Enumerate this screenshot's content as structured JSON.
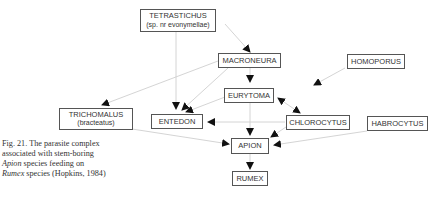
{
  "diagram": {
    "nodes": {
      "tetrastichus": {
        "label": "TETRASTICHUS",
        "sub": "(sp. nr evonymellae)"
      },
      "macroneura": {
        "label": "MACRONEURA"
      },
      "homoporus": {
        "label": "HOMOPORUS"
      },
      "eurytoma": {
        "label": "EURYTOMA"
      },
      "trichomalus": {
        "label": "TRICHOMALUS",
        "sub": "(bracteatus)"
      },
      "entedon": {
        "label": "ENTEDON"
      },
      "chlorocytus": {
        "label": "CHLOROCYTUS"
      },
      "habrocytus": {
        "label": "HABROCYTUS"
      },
      "apion": {
        "label": "APION"
      },
      "rumex": {
        "label": "RUMEX"
      }
    },
    "edges": [
      {
        "from": "TETRASTICHUS",
        "to": "MACRONEURA"
      },
      {
        "from": "TETRASTICHUS",
        "to": "ENTEDON"
      },
      {
        "from": "MACRONEURA",
        "to": "EURYTOMA"
      },
      {
        "from": "MACRONEURA",
        "to": "TRICHOMALUS"
      },
      {
        "from": "MACRONEURA",
        "to": "ENTEDON"
      },
      {
        "from": "HOMOPORUS",
        "to": "EURYTOMA"
      },
      {
        "from": "EURYTOMA",
        "to": "ENTEDON"
      },
      {
        "from": "EURYTOMA",
        "to": "APION"
      },
      {
        "from": "EURYTOMA",
        "to": "CHLOROCYTUS",
        "bidirectional": true
      },
      {
        "from": "CHLOROCYTUS",
        "to": "ENTEDON"
      },
      {
        "from": "CHLOROCYTUS",
        "to": "APION"
      },
      {
        "from": "HABROCYTUS",
        "to": "APION"
      },
      {
        "from": "TRICHOMALUS",
        "to": "APION"
      },
      {
        "from": "ENTEDON",
        "to": "APION"
      },
      {
        "from": "APION",
        "to": "RUMEX"
      }
    ],
    "caption": {
      "line1": "Fig. 21. The parasite complex",
      "line2": "associated with stem-boring",
      "line3_italic": "Apion",
      "line3_rest": " species feeding on",
      "line4_italic": "Rumex",
      "line4_rest": " species (Hopkins, 1984)"
    },
    "colors": {
      "edge": "#cfcfcf",
      "arrowhead": "#111111",
      "box_border": "#555555"
    }
  }
}
